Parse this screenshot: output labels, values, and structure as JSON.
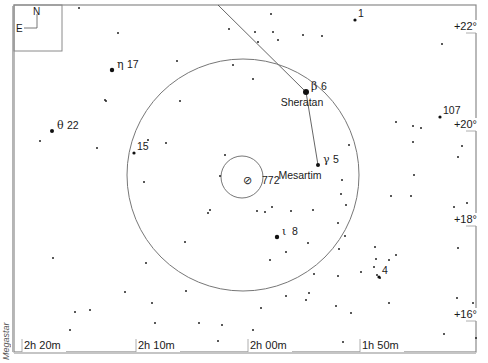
{
  "credit": "Megastar",
  "compass": {
    "north": "N",
    "east": "E"
  },
  "ra_labels": [
    {
      "text": "2h 20m",
      "x": 24
    },
    {
      "text": "2h 10m",
      "x": 138
    },
    {
      "text": "2h 00m",
      "x": 250
    },
    {
      "text": "1h 50m",
      "x": 362
    }
  ],
  "dec_labels": [
    {
      "text": "+22°",
      "y": 30
    },
    {
      "text": "+20°",
      "y": 128
    },
    {
      "text": "+18°",
      "y": 223
    },
    {
      "text": "+16°",
      "y": 318
    }
  ],
  "fov_circle": {
    "cx": 243,
    "cy": 175,
    "r": 116
  },
  "object_circle": {
    "cx": 242,
    "cy": 177,
    "r": 21
  },
  "target": {
    "symbol": "⊘",
    "label": "772",
    "x": 256,
    "y": 184
  },
  "named_stars": [
    {
      "greek": "β",
      "num": "6",
      "name": "Sheratan",
      "x": 306,
      "y": 92,
      "size": 3
    },
    {
      "greek": "γ",
      "num": "5",
      "name": "Mesartim",
      "x": 318,
      "y": 165,
      "size": 2
    },
    {
      "greek": "η",
      "num": "17",
      "name": "",
      "x": 112,
      "y": 70,
      "size": 2.2
    },
    {
      "greek": "θ",
      "num": "22",
      "name": "",
      "x": 52,
      "y": 131,
      "size": 2
    },
    {
      "greek": "ι",
      "num": "8",
      "name": "",
      "x": 277,
      "y": 237,
      "size": 2.2
    }
  ],
  "numbered_stars": [
    {
      "num": "1",
      "x": 355,
      "y": 20
    },
    {
      "num": "107",
      "x": 440,
      "y": 117
    },
    {
      "num": "15",
      "x": 134,
      "y": 153
    },
    {
      "num": "4",
      "x": 379,
      "y": 277
    }
  ],
  "asterism_lines": [
    {
      "x1": 218,
      "y1": 5,
      "x2": 306,
      "y2": 92
    },
    {
      "x1": 306,
      "y1": 92,
      "x2": 318,
      "y2": 165
    }
  ],
  "field_stars": [
    [
      79,
      8
    ],
    [
      118,
      33
    ],
    [
      105,
      100
    ],
    [
      106,
      101
    ],
    [
      148,
      140
    ],
    [
      97,
      148
    ],
    [
      40,
      141
    ],
    [
      53,
      258
    ],
    [
      180,
      101
    ],
    [
      144,
      182
    ],
    [
      166,
      143
    ],
    [
      208,
      213
    ],
    [
      210,
      210
    ],
    [
      185,
      242
    ],
    [
      146,
      263
    ],
    [
      125,
      292
    ],
    [
      90,
      310
    ],
    [
      75,
      312
    ],
    [
      70,
      330
    ],
    [
      155,
      323
    ],
    [
      152,
      303
    ],
    [
      166,
      341
    ],
    [
      177,
      61
    ],
    [
      229,
      29
    ],
    [
      258,
      42
    ],
    [
      253,
      79
    ],
    [
      233,
      65
    ],
    [
      271,
      14
    ],
    [
      278,
      40
    ],
    [
      322,
      36
    ],
    [
      303,
      35
    ],
    [
      255,
      32
    ],
    [
      273,
      32
    ],
    [
      220,
      176
    ],
    [
      265,
      212
    ],
    [
      225,
      155
    ],
    [
      257,
      211
    ],
    [
      291,
      211
    ],
    [
      272,
      207
    ],
    [
      270,
      260
    ],
    [
      286,
      252
    ],
    [
      308,
      243
    ],
    [
      313,
      210
    ],
    [
      342,
      180
    ],
    [
      341,
      194
    ],
    [
      346,
      205
    ],
    [
      338,
      223
    ],
    [
      345,
      236
    ],
    [
      339,
      249
    ],
    [
      314,
      274
    ],
    [
      306,
      300
    ],
    [
      286,
      296
    ],
    [
      338,
      276
    ],
    [
      361,
      272
    ],
    [
      374,
      267
    ],
    [
      377,
      275
    ],
    [
      380,
      278
    ],
    [
      396,
      255
    ],
    [
      376,
      259
    ],
    [
      389,
      260
    ],
    [
      375,
      247
    ],
    [
      391,
      196
    ],
    [
      411,
      196
    ],
    [
      413,
      142
    ],
    [
      413,
      126
    ],
    [
      396,
      122
    ],
    [
      349,
      145
    ],
    [
      414,
      175
    ],
    [
      389,
      303
    ],
    [
      336,
      306
    ],
    [
      351,
      313
    ],
    [
      309,
      293
    ],
    [
      343,
      342
    ],
    [
      259,
      341
    ],
    [
      253,
      330
    ],
    [
      218,
      341
    ],
    [
      222,
      325
    ],
    [
      199,
      323
    ],
    [
      186,
      291
    ],
    [
      261,
      308
    ],
    [
      442,
      44
    ],
    [
      421,
      128
    ],
    [
      458,
      157
    ],
    [
      462,
      146
    ],
    [
      467,
      203
    ],
    [
      454,
      207
    ],
    [
      458,
      248
    ],
    [
      457,
      298
    ],
    [
      473,
      303
    ],
    [
      444,
      334
    ],
    [
      476,
      338
    ],
    [
      268,
      342
    ],
    [
      251,
      350
    ]
  ]
}
